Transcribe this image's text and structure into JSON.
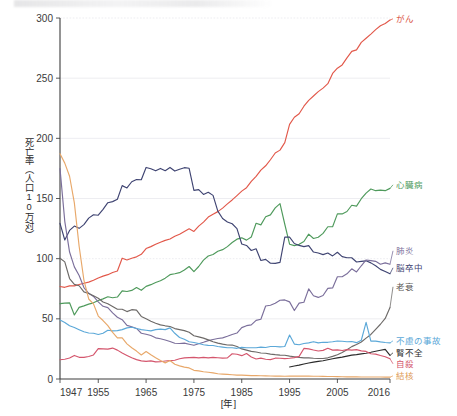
{
  "figure": {
    "y_axis_title": "死亡率（人口10万対）",
    "x_axis_title": "[年]"
  },
  "chart_data": {
    "type": "line",
    "title": "",
    "subtitle": "",
    "xlabel": "[年]",
    "ylabel": "死亡率（人口10万対）",
    "xlim": [
      1947,
      2016
    ],
    "ylim": [
      0,
      300
    ],
    "ytick_values": [
      0,
      50,
      100,
      150,
      200,
      250,
      300
    ],
    "ytick_labels": [
      "0",
      "50",
      "100",
      "150",
      "200",
      "250",
      "300"
    ],
    "xtick_values": [
      1947,
      1955,
      1965,
      1975,
      1985,
      1995,
      2005,
      2016
    ],
    "xtick_labels": [
      "1947",
      "1955",
      "1965",
      "1975",
      "1985",
      "1995",
      "2005",
      "2016"
    ],
    "grid": "horizontal",
    "legend_position": "right-inline-labels",
    "x": [
      1947,
      1948,
      1949,
      1950,
      1951,
      1952,
      1953,
      1954,
      1955,
      1956,
      1957,
      1958,
      1959,
      1960,
      1961,
      1962,
      1963,
      1964,
      1965,
      1966,
      1967,
      1968,
      1969,
      1970,
      1971,
      1972,
      1973,
      1974,
      1975,
      1976,
      1977,
      1978,
      1979,
      1980,
      1981,
      1982,
      1983,
      1984,
      1985,
      1986,
      1987,
      1988,
      1989,
      1990,
      1991,
      1992,
      1993,
      1994,
      1995,
      1996,
      1997,
      1998,
      1999,
      2000,
      2001,
      2002,
      2003,
      2004,
      2005,
      2006,
      2007,
      2008,
      2009,
      2010,
      2011,
      2012,
      2013,
      2014,
      2015,
      2016
    ],
    "series": [
      {
        "name": "がん",
        "label": "がん",
        "color": "#e2584a",
        "label_color": "#d9533f",
        "values": [
          76.9,
          76.2,
          77.4,
          77.4,
          78.5,
          79.6,
          80.5,
          82.0,
          84.0,
          85.5,
          86.7,
          88.5,
          89.8,
          100.4,
          98.9,
          100.4,
          101.5,
          103.6,
          108.4,
          110.0,
          112.0,
          113.7,
          115.2,
          116.3,
          118.6,
          120.3,
          122.6,
          124.8,
          122.6,
          127.0,
          130.4,
          134.6,
          137.0,
          139.1,
          142.0,
          145.5,
          148.8,
          152.4,
          156.1,
          159.0,
          164.2,
          168.4,
          173.6,
          177.2,
          182.2,
          187.8,
          190.2,
          196.4,
          211.6,
          217.5,
          220.4,
          226.7,
          231.6,
          235.2,
          238.8,
          241.7,
          245.4,
          253.9,
          258.3,
          261.0,
          266.9,
          272.3,
          273.5,
          279.7,
          283.2,
          286.6,
          290.3,
          293.5,
          295.5,
          298.3
        ]
      },
      {
        "name": "心臓病",
        "label": "心臓病",
        "color": "#4f9a5c",
        "label_color": "#4f9a5c",
        "values": [
          62.6,
          63.0,
          63.3,
          53.2,
          59.5,
          60.8,
          62.2,
          63.3,
          65.2,
          66.6,
          68.3,
          67.5,
          68.1,
          73.2,
          72.7,
          73.6,
          76.0,
          73.7,
          77.0,
          78.4,
          80.2,
          81.6,
          83.8,
          86.7,
          87.5,
          88.4,
          90.6,
          93.5,
          89.2,
          93.5,
          98.8,
          102.2,
          103.5,
          106.2,
          107.5,
          110.0,
          113.4,
          116.2,
          117.3,
          115.4,
          118.0,
          129.4,
          128.1,
          134.8,
          136.4,
          142.2,
          145.7,
          128.6,
          112.0,
          110.8,
          111.9,
          114.3,
          120.4,
          116.8,
          117.8,
          121.0,
          126.5,
          126.5,
          137.2,
          137.2,
          139.2,
          144.4,
          143.7,
          149.8,
          154.5,
          157.9,
          156.5,
          157.0,
          156.5,
          158.4
        ]
      },
      {
        "name": "脳卒中",
        "label": "脳卒中",
        "color": "#3f4472",
        "label_color": "#3f4472",
        "values": [
          129.4,
          115.5,
          123.5,
          127.1,
          125.2,
          128.3,
          133.7,
          136.5,
          136.1,
          141.0,
          146.5,
          147.4,
          149.4,
          160.7,
          158.8,
          163.9,
          165.8,
          165.6,
          175.8,
          174.7,
          173.0,
          175.0,
          173.1,
          175.8,
          172.8,
          174.3,
          175.6,
          175.1,
          156.7,
          157.4,
          153.4,
          155.2,
          152.6,
          139.5,
          133.4,
          130.5,
          129.0,
          125.0,
          112.2,
          111.0,
          106.8,
          108.2,
          98.5,
          99.4,
          96.2,
          96.1,
          96.9,
          117.9,
          117.9,
          112.6,
          111.0,
          110.0,
          110.8,
          105.5,
          104.7,
          103.4,
          104.7,
          102.3,
          105.3,
          101.7,
          100.8,
          100.8,
          97.2,
          97.7,
          98.2,
          96.5,
          94.1,
          91.1,
          89.4,
          87.4
        ]
      },
      {
        "name": "肺炎",
        "label": "肺炎",
        "color": "#7b6f9b",
        "label_color": "#7b6f9b",
        "values": [
          174.8,
          131.0,
          105.5,
          93.2,
          86.0,
          76.0,
          71.2,
          68.6,
          64.1,
          60.4,
          59.3,
          55.0,
          51.3,
          49.3,
          44.6,
          43.4,
          42.0,
          38.0,
          37.2,
          36.1,
          34.2,
          33.4,
          32.4,
          31.2,
          29.7,
          29.5,
          29.8,
          28.9,
          28.0,
          29.3,
          30.5,
          31.9,
          32.8,
          33.7,
          34.2,
          35.5,
          37.0,
          38.2,
          42.7,
          44.3,
          45.0,
          48.7,
          49.7,
          60.7,
          61.3,
          63.0,
          65.4,
          65.7,
          64.1,
          56.9,
          63.1,
          63.8,
          74.9,
          69.2,
          67.8,
          69.4,
          75.3,
          75.7,
          85.0,
          85.0,
          87.4,
          91.6,
          89.0,
          94.1,
          98.9,
          98.4,
          97.8,
          95.4,
          96.5,
          95.4
        ]
      },
      {
        "name": "老衰",
        "label": "老衰",
        "color": "#6d6a68",
        "label_color": "#5d5a58",
        "values": [
          100.4,
          97.3,
          83.5,
          78.6,
          77.5,
          72.4,
          71.0,
          69.1,
          67.1,
          64.0,
          62.5,
          60.2,
          58.0,
          58.0,
          56.0,
          57.6,
          57.2,
          52.0,
          50.0,
          48.0,
          46.4,
          45.0,
          44.2,
          43.6,
          41.9,
          41.0,
          40.2,
          38.8,
          35.9,
          35.0,
          34.0,
          32.5,
          31.0,
          29.8,
          29.0,
          28.3,
          28.2,
          27.0,
          25.0,
          24.0,
          23.0,
          22.4,
          21.6,
          21.4,
          20.7,
          20.2,
          19.8,
          19.7,
          19.0,
          18.5,
          18.0,
          17.6,
          17.5,
          17.2,
          17.0,
          17.0,
          17.6,
          18.8,
          20.2,
          22.0,
          24.4,
          26.9,
          28.6,
          30.7,
          34.0,
          37.0,
          41.3,
          45.5,
          50.3,
          59.5
        ]
      },
      {
        "name": "不慮の事故",
        "label": "不慮の事故",
        "color": "#5ba8d8",
        "label_color": "#5ba8d8",
        "values": [
          49.0,
          47.0,
          44.2,
          42.8,
          41.0,
          39.3,
          38.2,
          38.0,
          37.0,
          38.0,
          40.5,
          40.0,
          40.2,
          41.0,
          42.5,
          43.0,
          42.0,
          41.0,
          40.5,
          40.0,
          41.0,
          41.5,
          41.0,
          42.5,
          38.0,
          34.5,
          33.0,
          31.0,
          30.3,
          29.5,
          28.5,
          28.0,
          27.8,
          27.0,
          26.5,
          26.0,
          26.0,
          25.5,
          26.3,
          26.0,
          26.0,
          26.0,
          26.5,
          26.2,
          27.0,
          27.0,
          26.7,
          27.0,
          36.5,
          29.0,
          28.5,
          29.5,
          30.0,
          31.0,
          30.0,
          30.5,
          30.5,
          31.0,
          31.6,
          31.4,
          31.0,
          31.2,
          30.2,
          32.2,
          47.1,
          31.5,
          31.5,
          30.8,
          30.3,
          30.0
        ]
      },
      {
        "name": "腎不全",
        "label": "腎不全",
        "color": "#2b2b2b",
        "label_color": "#2b2b2b",
        "values": [
          0,
          0,
          0,
          0,
          0,
          0,
          0,
          0,
          0,
          0,
          0,
          0,
          0,
          0,
          0,
          0,
          0,
          0,
          0,
          0,
          0,
          0,
          0,
          0,
          0,
          0,
          0,
          0,
          0,
          0,
          0,
          0,
          0,
          0,
          0,
          0,
          0,
          0,
          0,
          0,
          0,
          0,
          0,
          0,
          0,
          0,
          0,
          0,
          10.0,
          10.8,
          11.5,
          12.5,
          13.3,
          14.0,
          14.6,
          15.2,
          16.0,
          16.8,
          17.5,
          18.2,
          19.0,
          19.8,
          20.2,
          20.9,
          21.4,
          22.2,
          23.1,
          23.9,
          24.6,
          19.6
        ]
      },
      {
        "name": "自殺",
        "label": "自殺",
        "color": "#d4566d",
        "label_color": "#d4566d",
        "values": [
          16.0,
          16.4,
          17.4,
          19.6,
          18.0,
          18.0,
          18.7,
          20.0,
          25.2,
          25.0,
          24.8,
          25.7,
          24.0,
          21.6,
          19.6,
          17.6,
          16.1,
          15.1,
          14.7,
          15.1,
          14.2,
          14.3,
          15.0,
          15.3,
          15.6,
          16.8,
          17.5,
          17.8,
          18.0,
          17.6,
          18.0,
          17.6,
          18.0,
          17.7,
          17.4,
          17.5,
          21.0,
          20.6,
          19.4,
          21.2,
          18.3,
          16.6,
          17.3,
          16.4,
          16.1,
          17.3,
          17.2,
          16.9,
          17.2,
          17.8,
          18.8,
          25.4,
          25.0,
          24.1,
          23.3,
          23.8,
          25.5,
          24.0,
          24.2,
          23.7,
          24.4,
          24.0,
          24.4,
          23.4,
          22.9,
          21.0,
          20.7,
          19.5,
          18.5,
          16.8
        ]
      },
      {
        "name": "結核",
        "label": "結核",
        "color": "#e8a86a",
        "label_color": "#dd9a55",
        "values": [
          187.2,
          179.4,
          168.5,
          146.4,
          110.3,
          82.2,
          66.5,
          62.4,
          52.3,
          48.6,
          44.3,
          38.8,
          34.2,
          34.2,
          29.2,
          26.0,
          23.2,
          20.0,
          22.8,
          20.1,
          17.6,
          15.3,
          13.4,
          15.4,
          12.2,
          10.9,
          9.9,
          9.2,
          7.2,
          6.8,
          6.0,
          5.6,
          5.1,
          4.4,
          4.1,
          3.8,
          3.5,
          3.2,
          3.2,
          3.0,
          2.8,
          2.8,
          2.7,
          2.6,
          2.5,
          2.4,
          2.4,
          2.3,
          2.4,
          2.5,
          2.4,
          2.4,
          2.4,
          2.3,
          2.3,
          2.2,
          2.1,
          2.1,
          2.0,
          1.9,
          1.8,
          1.8,
          1.8,
          1.7,
          1.7,
          1.7,
          1.7,
          1.7,
          1.6,
          1.5
        ]
      }
    ],
    "label_positions": [
      {
        "name": "がん",
        "x": 396,
        "y": 22
      },
      {
        "name": "心臓病",
        "x": 396,
        "y": 188
      },
      {
        "name": "肺炎",
        "x": 396,
        "y": 254
      },
      {
        "name": "脳卒中",
        "x": 396,
        "y": 271
      },
      {
        "name": "老衰",
        "x": 396,
        "y": 290
      },
      {
        "name": "不慮の事故",
        "x": 396,
        "y": 344
      },
      {
        "name": "腎不全",
        "x": 396,
        "y": 356
      },
      {
        "name": "自殺",
        "x": 396,
        "y": 367
      },
      {
        "name": "結核",
        "x": 396,
        "y": 379
      }
    ]
  }
}
